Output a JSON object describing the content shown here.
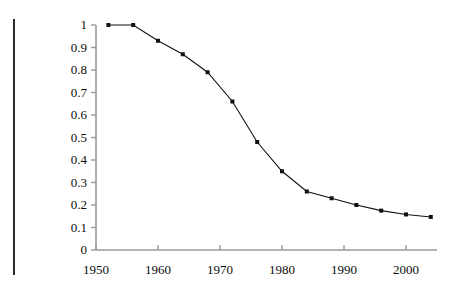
{
  "chart_data": {
    "type": "line",
    "title": "",
    "subtitle": "",
    "xlabel": "",
    "ylabel": "",
    "xlim": [
      1950,
      2005
    ],
    "ylim": [
      0,
      1
    ],
    "grid": false,
    "legend": null,
    "x_tick_labels": [
      "1950",
      "1960",
      "1970",
      "1980",
      "1990",
      "2000"
    ],
    "x_ticks": [
      1950,
      1960,
      1970,
      1980,
      1990,
      2000
    ],
    "y_tick_labels": [
      "0",
      "0.1",
      "0.2",
      "0.3",
      "0.4",
      "0.5",
      "0.6",
      "0.7",
      "0.8",
      "0.9",
      "1"
    ],
    "y_ticks": [
      0,
      0.1,
      0.2,
      0.3,
      0.4,
      0.5,
      0.6,
      0.7,
      0.8,
      0.9,
      1
    ],
    "series": [
      {
        "name": "series-1",
        "marker": "square",
        "color": "#111111",
        "x": [
          1952,
          1956,
          1960,
          1964,
          1968,
          1972,
          1976,
          1980,
          1984,
          1988,
          1992,
          1996,
          2000,
          2004
        ],
        "values": [
          1.0,
          1.0,
          0.93,
          0.87,
          0.79,
          0.66,
          0.48,
          0.35,
          0.26,
          0.23,
          0.2,
          0.175,
          0.158,
          0.147
        ]
      }
    ]
  },
  "style": {
    "axis_color": "#9a9a9a",
    "line_color": "#111111",
    "marker_color": "#111111",
    "rule_color": "#2b2b2b",
    "background": "#ffffff"
  },
  "geometry": {
    "plot_left": 96,
    "plot_right": 437,
    "plot_top": 25,
    "plot_bottom": 250
  }
}
